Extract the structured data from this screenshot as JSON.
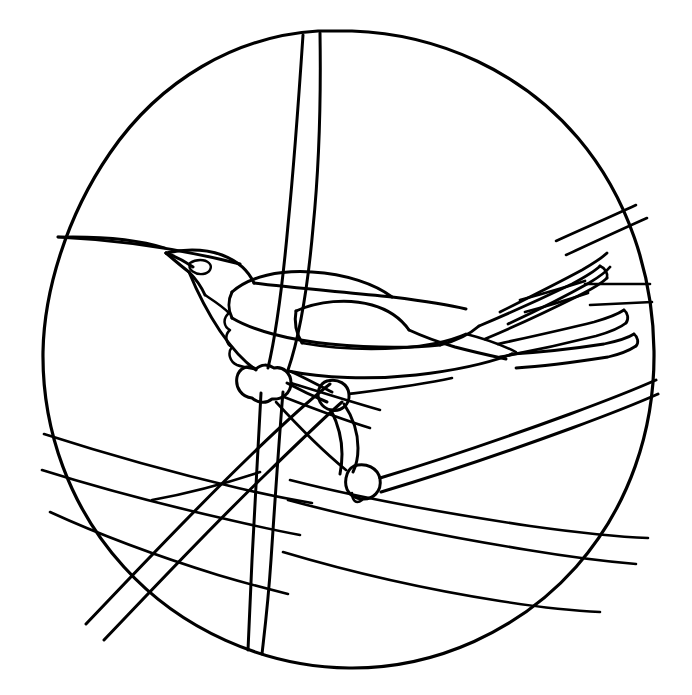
{
  "artwork": {
    "title": "Stained Glass Bird Pattern",
    "subject": "perched long-tailed bird on branches",
    "style": "black line art on white, circular medallion",
    "canvas": {
      "width": 692,
      "height": 695
    },
    "colors": {
      "background": "#ffffff",
      "line": "#000000"
    },
    "medallion": {
      "label": "circular border",
      "center_x": 347,
      "center_y": 348,
      "radius_x": 305,
      "radius_y": 312
    },
    "parts": [
      {
        "name": "circle-border",
        "label": "Circular outer rim"
      },
      {
        "name": "vertical-stem",
        "label": "Vertical twin-line stem"
      },
      {
        "name": "bird-head",
        "label": "Bird head"
      },
      {
        "name": "bird-beak",
        "label": "Bird beak"
      },
      {
        "name": "bird-eye",
        "label": "Bird eye"
      },
      {
        "name": "bird-breast",
        "label": "Bird breast and throat"
      },
      {
        "name": "bird-body",
        "label": "Bird body"
      },
      {
        "name": "bird-wing",
        "label": "Bird wing"
      },
      {
        "name": "bird-tail",
        "label": "Long layered tail feathers"
      },
      {
        "name": "bird-legs",
        "label": "Bird legs and claws"
      },
      {
        "name": "branch-main",
        "label": "Main perch branch"
      },
      {
        "name": "branch-lower-left",
        "label": "Lower left branches"
      },
      {
        "name": "branch-lower-right",
        "label": "Lower right branches"
      },
      {
        "name": "branch-upper-right",
        "label": "Upper right branches"
      },
      {
        "name": "joint-nodes",
        "label": "Branch joint knots"
      }
    ]
  }
}
